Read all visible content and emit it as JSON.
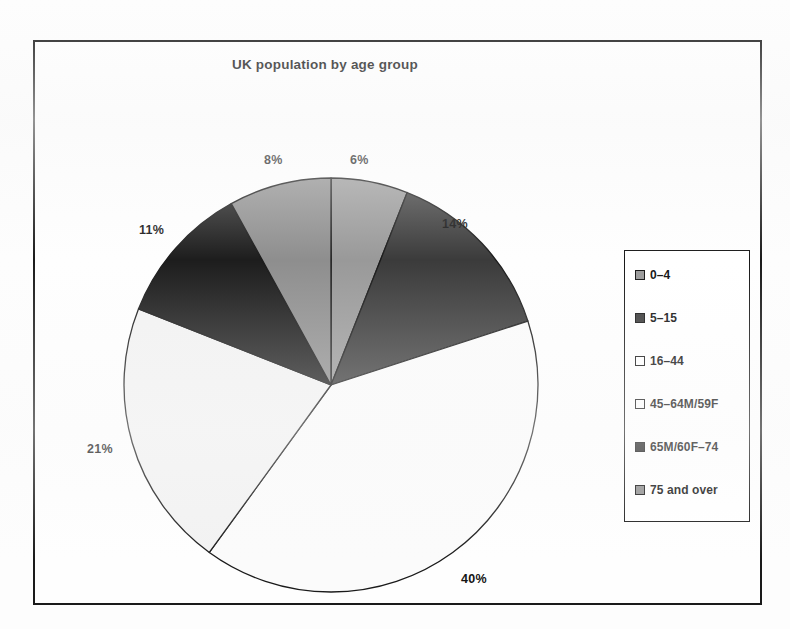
{
  "chart_data": {
    "type": "pie",
    "title": "UK population by age group",
    "categories": [
      "0–4",
      "5–15",
      "16–44",
      "45–64M/59F",
      "65M/60F–74",
      "75 and over"
    ],
    "values": [
      6,
      14,
      40,
      21,
      11,
      8
    ],
    "value_labels": [
      "6%",
      "14%",
      "40%",
      "21%",
      "11%",
      "8%"
    ],
    "units": "percent",
    "legend_position": "right",
    "grid": false,
    "start_angle_deg": 0,
    "direction": "clockwise",
    "slice_colors": [
      "#999999",
      "#3b3b3b",
      "#fbfbfb",
      "#f2f2f2",
      "#1d1d1d",
      "#8e8e8e"
    ],
    "slice_border_color": "#1a1a1a",
    "frame_color": "#1a1a1a",
    "background": "#fefefe",
    "slices": [
      {
        "label": "0–4",
        "value": 6,
        "display": "6%",
        "color": "#999999",
        "label_x": 348,
        "label_y": 151
      },
      {
        "label": "5–15",
        "value": 14,
        "display": "14%",
        "color": "#3b3b3b",
        "label_x": 440,
        "label_y": 215
      },
      {
        "label": "16–44",
        "value": 40,
        "display": "40%",
        "color": "#fbfbfb",
        "label_x": 459,
        "label_y": 570
      },
      {
        "label": "45–64M/59F",
        "value": 21,
        "display": "21%",
        "color": "#f2f2f2",
        "label_x": 85,
        "label_y": 440
      },
      {
        "label": "65M/60F–74",
        "value": 11,
        "display": "11%",
        "color": "#1d1d1d",
        "label_x": 137,
        "label_y": 221
      },
      {
        "label": "75 and over",
        "value": 8,
        "display": "8%",
        "color": "#8e8e8e",
        "label_x": 262,
        "label_y": 151
      }
    ]
  },
  "chart": {
    "title": "UK population by age group"
  },
  "legend": {
    "items": [
      {
        "label": "0–4",
        "color": "#999999"
      },
      {
        "label": "5–15",
        "color": "#3b3b3b"
      },
      {
        "label": "16–44",
        "color": "#ffffff"
      },
      {
        "label": "45–64M/59F",
        "color": "#fdfdfd"
      },
      {
        "label": "65M/60F–74",
        "color": "#232323"
      },
      {
        "label": "75 and over",
        "color": "#8e8e8e"
      }
    ]
  }
}
